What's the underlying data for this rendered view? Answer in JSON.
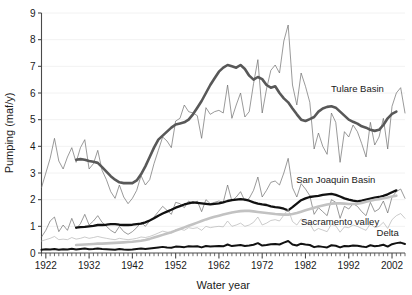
{
  "chart_data": {
    "type": "line",
    "title": "",
    "xlabel": "Water year",
    "ylabel": "Pumping (maf/y)",
    "xlim": [
      1921,
      2005
    ],
    "ylim": [
      0,
      9
    ],
    "yticks": [
      0,
      1,
      2,
      3,
      4,
      5,
      6,
      7,
      8,
      9
    ],
    "xticks": [
      1922,
      1932,
      1942,
      1952,
      1962,
      1972,
      1982,
      1992,
      2002
    ],
    "xtick_labels": [
      "1922",
      "1932",
      "1942",
      "1952",
      "1962",
      "1972",
      "1982",
      "1992",
      "2002"
    ],
    "ytick_labels": [
      "0",
      "1",
      "2",
      "3",
      "4",
      "5",
      "6",
      "7",
      "8",
      "9"
    ],
    "minor_xtick_interval": 1,
    "grid": "faint horizontal gridlines at each integer y value",
    "legend": "inline series labels at right of plot",
    "annotations": [
      {
        "text": "Tulare Basin",
        "x": 1994,
        "y": 6.05
      },
      {
        "text": "San Joaquin Basin",
        "x": 1989,
        "y": 2.63
      },
      {
        "text": "Sacramento valley",
        "x": 1990,
        "y": 1.05
      },
      {
        "text": "Delta",
        "x": 2001,
        "y": 0.62
      }
    ],
    "series": [
      {
        "name": "Tulare Basin",
        "style": "annual",
        "color": "#6e6e6e",
        "width": 0.7,
        "x_start": 1921,
        "values": [
          2.45,
          3.0,
          3.55,
          4.3,
          3.45,
          3.15,
          3.6,
          3.95,
          3.4,
          3.95,
          4.25,
          3.15,
          3.35,
          3.85,
          3.1,
          2.75,
          2.3,
          2.05,
          2.55,
          2.1,
          1.85,
          2.05,
          2.35,
          2.9,
          2.55,
          2.75,
          3.35,
          3.85,
          4.35,
          4.2,
          3.95,
          4.95,
          5.05,
          5.55,
          5.3,
          5.25,
          5.15,
          4.3,
          5.45,
          5.2,
          5.3,
          5.35,
          5.25,
          6.3,
          5.05,
          5.55,
          6.0,
          5.1,
          5.3,
          6.35,
          7.25,
          5.25,
          6.15,
          6.85,
          7.05,
          6.75,
          7.95,
          8.55,
          6.3,
          5.55,
          6.75,
          6.25,
          5.65,
          3.9,
          4.5,
          4.0,
          3.7,
          5.25,
          4.9,
          3.4,
          4.55,
          4.35,
          4.8,
          4.55,
          4.1,
          3.6,
          4.9,
          4.05,
          4.35,
          5.05,
          3.9,
          5.5,
          6.0,
          6.2,
          5.25
        ]
      },
      {
        "name": "Tulare Basin",
        "style": "smoothed",
        "color": "#585858",
        "width": 2.6,
        "x_start": 1929,
        "values": [
          3.5,
          3.52,
          3.5,
          3.45,
          3.42,
          3.38,
          3.22,
          3.05,
          2.88,
          2.75,
          2.65,
          2.62,
          2.62,
          2.62,
          2.72,
          2.95,
          3.25,
          3.6,
          3.95,
          4.25,
          4.4,
          4.55,
          4.7,
          4.82,
          4.86,
          4.9,
          5.0,
          5.2,
          5.45,
          5.7,
          6.0,
          6.3,
          6.55,
          6.8,
          6.95,
          7.05,
          7.0,
          6.95,
          7.05,
          6.9,
          6.65,
          6.5,
          6.6,
          6.52,
          6.3,
          6.2,
          6.25,
          6.0,
          5.8,
          5.65,
          5.42,
          5.2,
          5.0,
          4.95,
          5.02,
          5.1,
          5.3,
          5.42,
          5.48,
          5.5,
          5.45,
          5.3,
          5.15,
          5.0,
          4.92,
          4.85,
          4.75,
          4.7,
          4.62,
          4.58,
          4.62,
          4.8,
          5.05,
          5.22,
          5.3
        ]
      },
      {
        "name": "San Joaquin Basin",
        "style": "annual",
        "color": "#6e6e6e",
        "width": 0.7,
        "x_start": 1921,
        "values": [
          0.6,
          0.85,
          1.2,
          1.35,
          0.8,
          1.05,
          0.85,
          1.3,
          0.9,
          1.1,
          1.45,
          1.05,
          1.2,
          1.4,
          1.15,
          1.0,
          0.85,
          0.75,
          1.0,
          0.8,
          0.7,
          0.8,
          0.95,
          1.15,
          1.0,
          1.2,
          1.35,
          1.55,
          1.75,
          1.6,
          1.45,
          1.9,
          1.85,
          1.7,
          1.95,
          1.85,
          1.95,
          1.55,
          2.0,
          1.85,
          1.9,
          1.95,
          1.9,
          2.55,
          1.95,
          2.1,
          2.3,
          1.95,
          2.05,
          2.35,
          2.85,
          2.1,
          2.35,
          2.65,
          2.7,
          2.55,
          3.0,
          3.55,
          2.45,
          2.1,
          2.6,
          2.4,
          2.15,
          1.45,
          1.7,
          1.55,
          1.4,
          2.0,
          1.9,
          1.3,
          1.75,
          1.65,
          1.85,
          1.75,
          1.55,
          1.4,
          1.9,
          1.55,
          1.65,
          1.95,
          1.5,
          2.1,
          2.3,
          2.4,
          2.05
        ]
      },
      {
        "name": "San Joaquin Basin",
        "style": "smoothed",
        "color": "#111111",
        "width": 2.3,
        "x_start": 1929,
        "values": [
          0.95,
          0.97,
          0.98,
          1.0,
          1.02,
          1.05,
          1.05,
          1.06,
          1.08,
          1.08,
          1.06,
          1.05,
          1.05,
          1.06,
          1.08,
          1.1,
          1.15,
          1.22,
          1.3,
          1.4,
          1.48,
          1.55,
          1.62,
          1.7,
          1.76,
          1.82,
          1.86,
          1.9,
          1.88,
          1.86,
          1.84,
          1.82,
          1.84,
          1.86,
          1.9,
          1.95,
          1.98,
          2.0,
          2.02,
          2.0,
          1.96,
          1.9,
          1.85,
          1.82,
          1.8,
          1.75,
          1.72,
          1.7,
          1.66,
          1.6,
          1.72,
          1.85,
          1.98,
          2.05,
          2.1,
          2.12,
          2.14,
          2.18,
          2.2,
          2.22,
          2.18,
          2.12,
          2.05,
          2.0,
          1.96,
          1.94,
          1.96,
          2.0,
          2.04,
          2.08,
          2.1,
          2.14,
          2.2,
          2.28,
          2.35
        ]
      },
      {
        "name": "Sacramento valley",
        "style": "annual",
        "color": "#b5b5b5",
        "width": 0.7,
        "x_start": 1921,
        "values": [
          0.45,
          0.5,
          0.55,
          0.62,
          0.5,
          0.52,
          0.5,
          0.58,
          0.52,
          0.55,
          0.6,
          0.55,
          0.58,
          0.62,
          0.58,
          0.55,
          0.52,
          0.5,
          0.55,
          0.52,
          0.5,
          0.52,
          0.55,
          0.6,
          0.58,
          0.62,
          0.68,
          0.75,
          0.82,
          0.78,
          0.75,
          0.88,
          0.9,
          0.85,
          0.95,
          0.92,
          0.95,
          0.85,
          1.0,
          0.95,
          0.98,
          1.0,
          0.98,
          1.2,
          1.0,
          1.05,
          1.12,
          1.0,
          1.05,
          1.15,
          1.35,
          1.05,
          1.12,
          1.22,
          1.25,
          1.2,
          1.42,
          1.65,
          1.18,
          1.05,
          1.28,
          1.18,
          1.1,
          0.82,
          0.92,
          0.86,
          0.8,
          1.08,
          1.02,
          0.78,
          0.98,
          0.95,
          1.05,
          1.0,
          0.92,
          0.85,
          1.1,
          0.95,
          1.0,
          1.15,
          0.92,
          1.25,
          1.4,
          1.48,
          1.3
        ]
      },
      {
        "name": "Sacramento valley",
        "style": "smoothed",
        "color": "#c2c2c2",
        "width": 2.6,
        "x_start": 1929,
        "values": [
          0.3,
          0.31,
          0.32,
          0.33,
          0.34,
          0.35,
          0.35,
          0.36,
          0.37,
          0.38,
          0.39,
          0.4,
          0.41,
          0.42,
          0.44,
          0.46,
          0.49,
          0.53,
          0.58,
          0.63,
          0.68,
          0.73,
          0.78,
          0.84,
          0.9,
          0.96,
          1.02,
          1.08,
          1.14,
          1.2,
          1.26,
          1.31,
          1.36,
          1.4,
          1.44,
          1.48,
          1.52,
          1.55,
          1.57,
          1.58,
          1.58,
          1.56,
          1.54,
          1.52,
          1.5,
          1.48,
          1.46,
          1.45,
          1.44,
          1.44,
          1.46,
          1.5,
          1.55,
          1.6,
          1.65,
          1.7,
          1.74,
          1.78,
          1.82,
          1.85,
          1.86,
          1.86,
          1.85,
          1.84,
          1.84,
          1.85,
          1.88,
          1.92,
          1.96,
          2.0,
          2.02,
          2.05,
          2.08,
          2.12,
          2.15
        ]
      },
      {
        "name": "Delta",
        "style": "annual",
        "color": "#111111",
        "width": 2.0,
        "x_start": 1921,
        "values": [
          0.12,
          0.14,
          0.13,
          0.15,
          0.12,
          0.14,
          0.13,
          0.16,
          0.13,
          0.15,
          0.17,
          0.14,
          0.15,
          0.17,
          0.15,
          0.14,
          0.13,
          0.12,
          0.15,
          0.13,
          0.12,
          0.13,
          0.15,
          0.17,
          0.15,
          0.17,
          0.19,
          0.21,
          0.23,
          0.21,
          0.2,
          0.24,
          0.23,
          0.22,
          0.25,
          0.24,
          0.25,
          0.21,
          0.26,
          0.24,
          0.25,
          0.26,
          0.25,
          0.32,
          0.26,
          0.28,
          0.3,
          0.26,
          0.28,
          0.31,
          0.37,
          0.28,
          0.3,
          0.33,
          0.34,
          0.32,
          0.39,
          0.45,
          0.32,
          0.28,
          0.35,
          0.32,
          0.3,
          0.22,
          0.25,
          0.23,
          0.21,
          0.29,
          0.27,
          0.21,
          0.26,
          0.25,
          0.28,
          0.27,
          0.24,
          0.22,
          0.29,
          0.25,
          0.27,
          0.31,
          0.24,
          0.33,
          0.37,
          0.39,
          0.34
        ]
      }
    ]
  }
}
